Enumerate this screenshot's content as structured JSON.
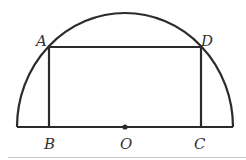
{
  "figure": {
    "shape": "semicircle with inscribed rectangle",
    "points": {
      "A": {
        "label": "A"
      },
      "B": {
        "label": "B"
      },
      "C": {
        "label": "C"
      },
      "D": {
        "label": "D"
      },
      "O": {
        "label": "O"
      }
    },
    "colors": {
      "stroke": "#2b2b2b",
      "label": "#333333",
      "separator": "#c8c8c8"
    }
  }
}
